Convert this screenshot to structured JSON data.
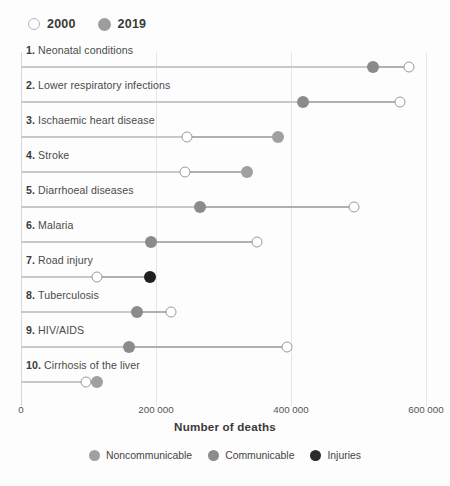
{
  "year_legend": {
    "items": [
      {
        "label": "2000",
        "style": "hollow"
      },
      {
        "label": "2019",
        "style": "solid"
      }
    ]
  },
  "axis": {
    "title": "Number of deaths",
    "ticks": [
      "0",
      "200 000",
      "400 000",
      "600 000"
    ],
    "tick_values": [
      0,
      200000,
      400000,
      600000
    ]
  },
  "category_legend": {
    "items": [
      {
        "label": "Noncommunicable",
        "color": "#a0a0a0"
      },
      {
        "label": "Communicable",
        "color": "#8b8b8b"
      },
      {
        "label": "Injuries",
        "color": "#2b2b2b"
      }
    ]
  },
  "colors": {
    "noncommunicable": "#a0a0a0",
    "communicable": "#8b8b8b",
    "injuries": "#1f1f1f",
    "hollow_fill": "#ffffff",
    "hollow_stroke": "#9a9a9a",
    "baseline": "#c9c9c9",
    "gridline": "#e6e6e6",
    "background": "#fdfdfd"
  },
  "chart_data": {
    "type": "line",
    "chart_subtype": "dumbbell",
    "title": "",
    "xlabel": "Number of deaths",
    "ylabel": "",
    "xlim": [
      0,
      620000
    ],
    "grid": true,
    "legend_position": "top-left and bottom-center",
    "categories": [
      "1. Neonatal conditions",
      "2. Lower respiratory infections",
      "3. Ischaemic heart disease",
      "4. Stroke",
      "5. Diarrhoeal diseases",
      "6. Malaria",
      "7. Road injury",
      "8. Tuberculosis",
      "9. HIV/AIDS",
      "10. Cirrhosis of the liver"
    ],
    "series": [
      {
        "name": "2000",
        "values": [
          575000,
          561000,
          246000,
          243000,
          493000,
          349000,
          112000,
          222000,
          394000,
          96000
        ]
      },
      {
        "name": "2019",
        "values": [
          521000,
          418000,
          381000,
          335000,
          265000,
          192000,
          191000,
          172000,
          160000,
          113000
        ]
      }
    ],
    "rows": [
      {
        "rank": "1.",
        "name": "Neonatal conditions",
        "v2000": 575000,
        "v2019": 521000,
        "cause_group": "communicable"
      },
      {
        "rank": "2.",
        "name": "Lower respiratory infections",
        "v2000": 561000,
        "v2019": 418000,
        "cause_group": "communicable"
      },
      {
        "rank": "3.",
        "name": "Ischaemic heart disease",
        "v2000": 246000,
        "v2019": 381000,
        "cause_group": "noncommunicable"
      },
      {
        "rank": "4.",
        "name": "Stroke",
        "v2000": 243000,
        "v2019": 335000,
        "cause_group": "noncommunicable"
      },
      {
        "rank": "5.",
        "name": "Diarrhoeal diseases",
        "v2000": 493000,
        "v2019": 265000,
        "cause_group": "communicable"
      },
      {
        "rank": "6.",
        "name": "Malaria",
        "v2000": 349000,
        "v2019": 192000,
        "cause_group": "communicable"
      },
      {
        "rank": "7.",
        "name": "Road injury",
        "v2000": 112000,
        "v2019": 191000,
        "cause_group": "injuries"
      },
      {
        "rank": "8.",
        "name": "Tuberculosis",
        "v2000": 222000,
        "v2019": 172000,
        "cause_group": "communicable"
      },
      {
        "rank": "9.",
        "name": "HIV/AIDS",
        "v2000": 394000,
        "v2019": 160000,
        "cause_group": "communicable"
      },
      {
        "rank": "10.",
        "name": "Cirrhosis of the liver",
        "v2000": 96000,
        "v2019": 113000,
        "cause_group": "noncommunicable"
      }
    ]
  }
}
